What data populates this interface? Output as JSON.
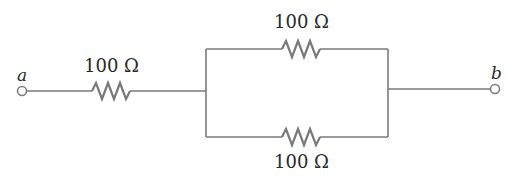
{
  "diagram": {
    "type": "circuit-schematic",
    "terminals": [
      {
        "id": "a",
        "label": "a"
      },
      {
        "id": "b",
        "label": "b"
      }
    ],
    "resistors": [
      {
        "id": "R1",
        "label": "100 Ω",
        "position": "series",
        "value_ohms": 100
      },
      {
        "id": "R2",
        "label": "100 Ω",
        "position": "parallel-top",
        "value_ohms": 100
      },
      {
        "id": "R3",
        "label": "100 Ω",
        "position": "parallel-bottom",
        "value_ohms": 100
      }
    ],
    "colors": {
      "wire": "#7a7a7a",
      "text": "#2a2a2a",
      "background": "#ffffff"
    }
  }
}
